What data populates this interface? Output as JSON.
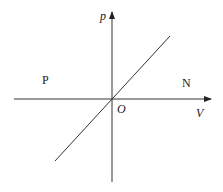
{
  "diagram": {
    "axes": {
      "y_label": "p",
      "x_label": "V",
      "origin_label": "O"
    },
    "regions": {
      "left": "P",
      "right": "N"
    },
    "colors": {
      "line": "#333333",
      "background": "#ffffff"
    }
  }
}
